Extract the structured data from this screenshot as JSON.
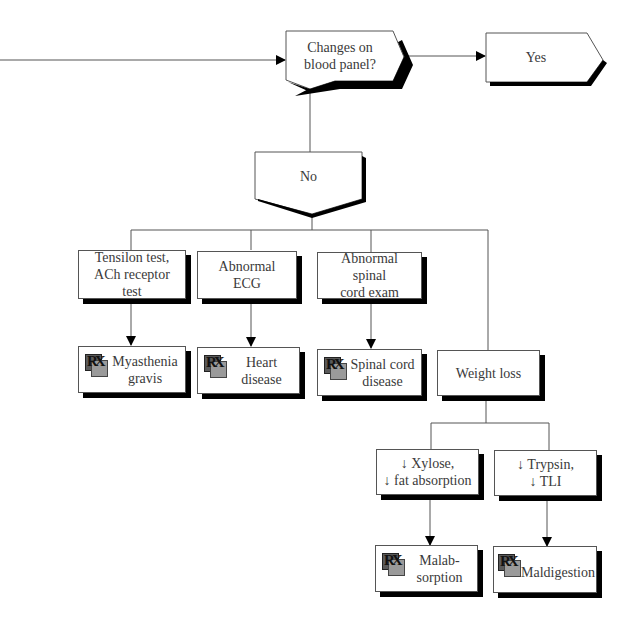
{
  "diagram": {
    "type": "flowchart",
    "decision": {
      "label": "Changes on blood panel?"
    },
    "yes_branch": {
      "label": "Yes"
    },
    "no_branch": {
      "label": "No"
    },
    "tests": [
      {
        "label": "Tensilon test, ACh receptor test",
        "diagnosis": "Myasthenia gravis"
      },
      {
        "label": "Abnormal ECG",
        "diagnosis": "Heart disease"
      },
      {
        "label": "Abnormal spinal cord exam",
        "diagnosis": "Spinal cord disease"
      }
    ],
    "weight_loss": {
      "label": "Weight loss",
      "children": [
        {
          "label": "↓ Xylose, ↓ fat absorption",
          "diagnosis": "Malab-sorption"
        },
        {
          "label": "↓ Trypsin, ↓ TLI",
          "diagnosis": "Maldigestion"
        }
      ]
    },
    "icons": {
      "diagnosis": "rx-icon",
      "arrow": "arrow-head"
    },
    "colors": {
      "line": "#555555",
      "shadow": "#000000",
      "box_fill": "#ffffff",
      "text": "#3a3a3a"
    }
  },
  "labels": {
    "decision_l1": "Changes on",
    "decision_l2": "blood panel?",
    "yes": "Yes",
    "no": "No",
    "t1_l1": "Tensilon test,",
    "t1_l2": "ACh receptor",
    "t1_l3": "test",
    "t2_l1": "Abnormal",
    "t2_l2": "ECG",
    "t3_l1": "Abnormal",
    "t3_l2": "spinal",
    "t3_l3": "cord exam",
    "d1_l1": "Myasthenia",
    "d1_l2": "gravis",
    "d2_l1": "Heart",
    "d2_l2": "disease",
    "d3_l1": "Spinal cord",
    "d3_l2": "disease",
    "weight_loss": "Weight loss",
    "w1_l1": "↓ Xylose,",
    "w1_l2": "↓ fat absorption",
    "w2_l1": "↓ Trypsin,",
    "w2_l2": "↓ TLI",
    "d4_l1": "Malab-",
    "d4_l2": "sorption",
    "d5": "Maldigestion",
    "rx_glyph": "RX"
  }
}
